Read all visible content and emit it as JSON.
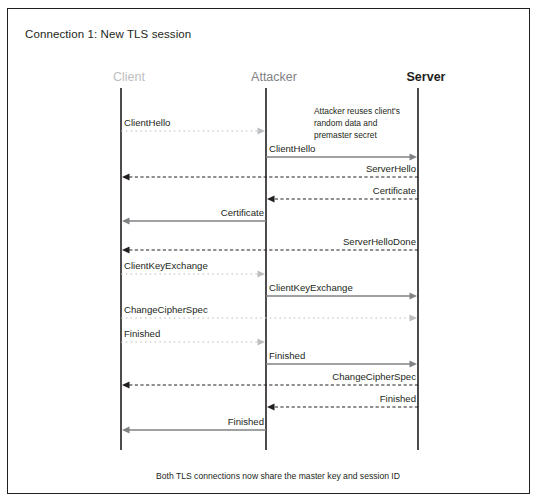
{
  "figure": {
    "title": "Connection 1: New TLS session",
    "footer_note": "Both TLS connections now share the master key and session ID",
    "border_color": "#231f20",
    "background": "#ffffff"
  },
  "actors": [
    {
      "name": "client",
      "label": "Client",
      "x": 121,
      "color": "#bcbec0"
    },
    {
      "name": "attacker",
      "label": "Attacker",
      "x": 266,
      "color": "#808285"
    },
    {
      "name": "server",
      "label": "Server",
      "x": 418,
      "color": "#231f20"
    }
  ],
  "annotation": {
    "lines": [
      "Attacker reuses client's",
      "random data and",
      "premaster secret"
    ],
    "line1": "Attacker reuses client's",
    "line2": "random data and",
    "line3": "premaster secret"
  },
  "messages": [
    {
      "label": "ClientHello",
      "from": "client",
      "to": "attacker",
      "y": 131,
      "style": "dotted",
      "color": "#bcbec0",
      "label_side": "left",
      "label_y": 118
    },
    {
      "label": "ClientHello",
      "from": "attacker",
      "to": "server",
      "y": 157,
      "style": "solid",
      "color": "#808285",
      "label_side": "left",
      "label_y": 144
    },
    {
      "label": "ServerHello",
      "from": "server",
      "to": "client",
      "y": 177,
      "style": "dashed",
      "color": "#231f20",
      "label_side": "right",
      "label_y": 164
    },
    {
      "label": "Certificate",
      "from": "server",
      "to": "attacker",
      "y": 199,
      "style": "dashed",
      "color": "#231f20",
      "label_side": "right",
      "label_y": 186
    },
    {
      "label": "Certificate",
      "from": "attacker",
      "to": "client",
      "y": 221,
      "style": "solid",
      "color": "#808285",
      "label_side": "right",
      "label_y": 208
    },
    {
      "label": "ServerHelloDone",
      "from": "server",
      "to": "client",
      "y": 250,
      "style": "dashed",
      "color": "#231f20",
      "label_side": "right",
      "label_y": 237
    },
    {
      "label": "ClientKeyExchange",
      "from": "client",
      "to": "attacker",
      "y": 274,
      "style": "dotted",
      "color": "#bcbec0",
      "label_side": "left",
      "label_y": 261
    },
    {
      "label": "ClientKeyExchange",
      "from": "attacker",
      "to": "server",
      "y": 296,
      "style": "solid",
      "color": "#808285",
      "label_side": "left",
      "label_y": 283
    },
    {
      "label": "ChangeCipherSpec",
      "from": "client",
      "to": "server",
      "y": 318,
      "style": "dotted",
      "color": "#bcbec0",
      "label_side": "left",
      "label_y": 305
    },
    {
      "label": "Finished",
      "from": "client",
      "to": "attacker",
      "y": 342,
      "style": "dotted",
      "color": "#bcbec0",
      "label_side": "left",
      "label_y": 329
    },
    {
      "label": "Finished",
      "from": "attacker",
      "to": "server",
      "y": 364,
      "style": "solid",
      "color": "#808285",
      "label_side": "left",
      "label_y": 351
    },
    {
      "label": "ChangeCipherSpec",
      "from": "server",
      "to": "client",
      "y": 385,
      "style": "dashed",
      "color": "#231f20",
      "label_side": "right",
      "label_y": 372
    },
    {
      "label": "Finished",
      "from": "server",
      "to": "attacker",
      "y": 407,
      "style": "dashed",
      "color": "#231f20",
      "label_side": "right",
      "label_y": 394
    },
    {
      "label": "Finished",
      "from": "attacker",
      "to": "client",
      "y": 430,
      "style": "solid",
      "color": "#808285",
      "label_side": "right",
      "label_y": 417
    }
  ],
  "lifelines": {
    "top": 88,
    "bottom": 450,
    "color": "#231f20"
  }
}
